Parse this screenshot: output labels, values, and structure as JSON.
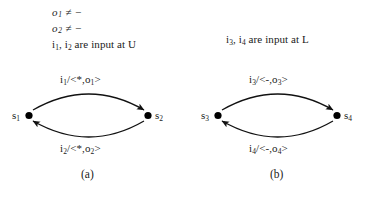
{
  "figure": {
    "conditions": [
      {
        "var": "o",
        "sub": "1",
        "relation": "≠",
        "value": "−"
      },
      {
        "var": "o",
        "sub": "2",
        "relation": "≠",
        "value": "−"
      }
    ],
    "input_notes": {
      "left": {
        "first": "i",
        "first_sub": "1",
        "second": "i",
        "second_sub": "2",
        "text": " are input at U"
      },
      "right": {
        "first": "i",
        "first_sub": "3",
        "second": "i",
        "second_sub": "4",
        "text": " are input at L"
      }
    },
    "diagrams": [
      {
        "id": "diagram-a",
        "caption": "(a)",
        "nodes": [
          {
            "name": "s",
            "sub": "1",
            "position": "left"
          },
          {
            "name": "s",
            "sub": "2",
            "position": "right"
          }
        ],
        "edges": [
          {
            "direction": "left-to-right",
            "input": "i",
            "input_sub": "1",
            "separator": "/",
            "output": "<*,o",
            "output_sub": "1",
            "output_close": ">"
          },
          {
            "direction": "right-to-left",
            "input": "i",
            "input_sub": "2",
            "separator": "/",
            "output": "<*,o",
            "output_sub": "2",
            "output_close": ">"
          }
        ]
      },
      {
        "id": "diagram-b",
        "caption": "(b)",
        "nodes": [
          {
            "name": "s",
            "sub": "3",
            "position": "left"
          },
          {
            "name": "s",
            "sub": "4",
            "position": "right"
          }
        ],
        "edges": [
          {
            "direction": "left-to-right",
            "input": "i",
            "input_sub": "3",
            "separator": "/",
            "output": "<-,o",
            "output_sub": "3",
            "output_close": ">"
          },
          {
            "direction": "right-to-left",
            "input": "i",
            "input_sub": "4",
            "separator": "/",
            "output": "<-,o",
            "output_sub": "4",
            "output_close": ">"
          }
        ]
      }
    ],
    "colors": {
      "ink": "#1a1a1a",
      "background": "#ffffff",
      "node_fill": "#000000"
    }
  }
}
